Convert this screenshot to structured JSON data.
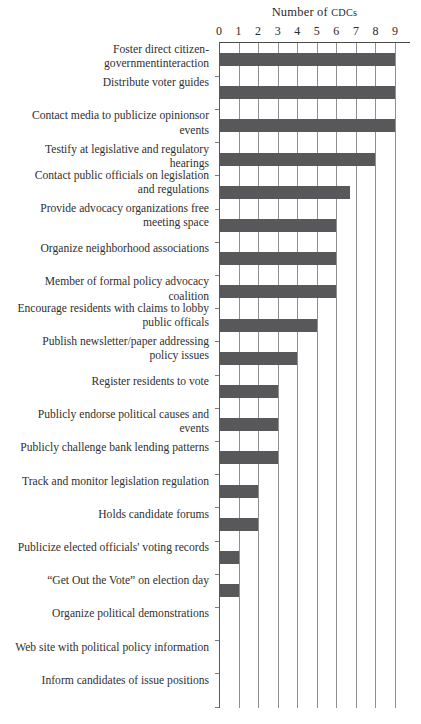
{
  "chart_data": {
    "type": "bar",
    "orientation": "horizontal",
    "title": "Number of CDCs",
    "title_prefix": "Number of ",
    "title_smallcaps": "CDCs",
    "xlabel": "Number of CDCs",
    "ylabel": "",
    "xlim": [
      0,
      9
    ],
    "xticks": [
      0,
      1,
      2,
      3,
      4,
      5,
      6,
      7,
      8,
      9
    ],
    "xticklabels": [
      "0",
      "1",
      "2",
      "3",
      "4",
      "5",
      "6",
      "7",
      "8",
      "9"
    ],
    "grid": "vertical",
    "legend": "none",
    "bar_color": "#58585a",
    "categories": [
      "Foster direct citizen-governmentinteraction",
      "Distribute voter guides",
      "Contact media to publicize opinionsor events",
      "Testify at legislative and regulatory hearings",
      "Contact public officials on legislation\nand regulations",
      "Provide advocacy organizations free\nmeeting space",
      "Organize neighborhood associations",
      "Member of formal policy advocacy coalition",
      "Encourage residents with claims to lobby\npublic officals",
      "Publish newsletter/paper addressing\npolicy issues",
      "Register residents to vote",
      "Publicly endorse political causes and events",
      "Publicly challenge bank lending patterns",
      "Track and monitor legislation regulation",
      "Holds candidate forums",
      "Publicize elected officials' voting records",
      "“Get Out the Vote” on election day",
      "Organize political demonstrations",
      "Web site with political policy information",
      "Inform candidates of issue positions"
    ],
    "values": [
      9,
      9,
      9,
      8,
      6.7,
      6,
      6,
      6,
      5,
      4,
      3,
      3,
      3,
      2,
      2,
      1,
      1,
      0,
      0,
      0
    ]
  }
}
